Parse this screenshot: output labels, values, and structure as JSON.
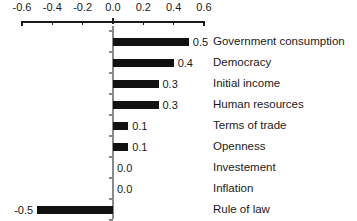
{
  "chart_data": {
    "type": "bar",
    "orientation": "horizontal",
    "title": "",
    "xlabel": "",
    "ylabel": "",
    "xlim": [
      -0.6,
      0.6
    ],
    "xticks": [
      "-0.6",
      "-0.4",
      "-0.2",
      "0.0",
      "0.2",
      "0.4",
      "0.6"
    ],
    "xtick_values": [
      -0.6,
      -0.4,
      -0.2,
      0.0,
      0.2,
      0.4,
      0.6
    ],
    "grid": false,
    "legend": "none",
    "axis_position": "top",
    "bar_color": "#111111",
    "axis_color": "#1a1a1a",
    "categories": [
      "Government consumption",
      "Democracy",
      "Initial income",
      "Human resources",
      "Terms of trade",
      "Openness",
      "Investement",
      "Inflation",
      "Rule of law"
    ],
    "values": [
      0.5,
      0.4,
      0.3,
      0.3,
      0.1,
      0.1,
      0.0,
      0.0,
      -0.5
    ],
    "value_labels": [
      "0.5",
      "0.4",
      "0.3",
      "0.3",
      "0.1",
      "0.1",
      "0.0",
      "0.0",
      "-0.5"
    ],
    "bar_pixel_lengths": [
      63,
      49,
      38,
      38,
      17,
      17,
      0,
      0,
      76
    ]
  }
}
